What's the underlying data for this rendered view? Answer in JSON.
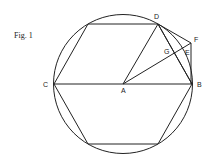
{
  "caption": "Fig. 1",
  "labels": {
    "A": "A",
    "B": "B",
    "C": "C",
    "D": "D",
    "E": "E",
    "F": "F",
    "G": "G"
  },
  "geometry": {
    "center": [
      123,
      84
    ],
    "radius": 69,
    "hexagon_vertices": [
      [
        192,
        84
      ],
      [
        158,
        24
      ],
      [
        88,
        24
      ],
      [
        54,
        84
      ],
      [
        88,
        144
      ],
      [
        158,
        144
      ]
    ],
    "points": {
      "A": [
        123,
        84
      ],
      "B": [
        192,
        84
      ],
      "C": [
        54,
        84
      ],
      "D": [
        158,
        24
      ],
      "F": [
        191,
        43
      ],
      "E": [
        186,
        51
      ],
      "G": [
        171,
        56
      ]
    }
  },
  "colors": {
    "stroke": "#222222",
    "background": "#ffffff"
  }
}
